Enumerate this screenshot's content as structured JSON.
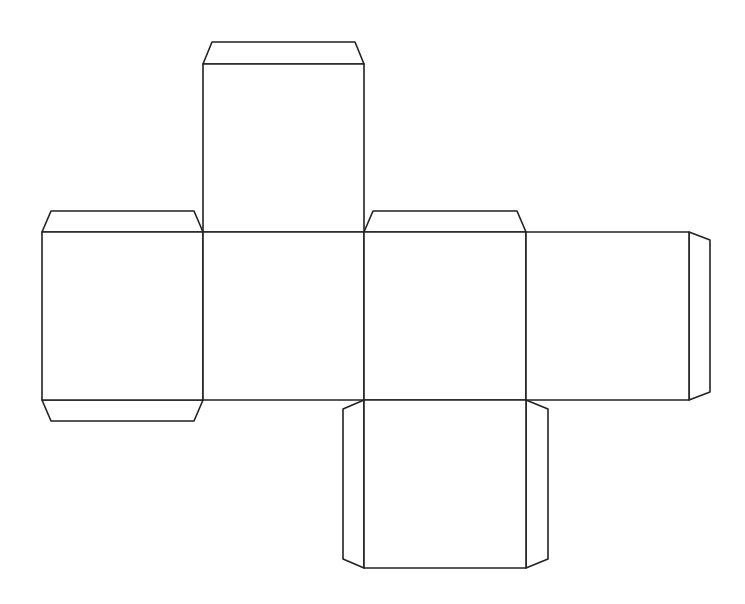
{
  "diagram": {
    "type": "cube-net",
    "stroke_color": "#222222",
    "background_color": "#ffffff",
    "faces": [
      {
        "id": "top",
        "x": 203,
        "y": 64,
        "w": 161,
        "h": 168
      },
      {
        "id": "left",
        "x": 42,
        "y": 232,
        "w": 161,
        "h": 168
      },
      {
        "id": "front",
        "x": 203,
        "y": 232,
        "w": 161,
        "h": 168
      },
      {
        "id": "right",
        "x": 364,
        "y": 232,
        "w": 162,
        "h": 168
      },
      {
        "id": "back",
        "x": 526,
        "y": 232,
        "w": 163,
        "h": 168
      },
      {
        "id": "bottom",
        "x": 364,
        "y": 400,
        "w": 162,
        "h": 168
      }
    ],
    "tabs": [
      {
        "id": "tab-top-face-top",
        "points": "203,64 212,42 355,42 364,64"
      },
      {
        "id": "tab-left-face-top",
        "points": "42,232 51,211 194,211 203,232"
      },
      {
        "id": "tab-left-face-bottom",
        "points": "42,400 51,421 194,421 203,400"
      },
      {
        "id": "tab-right-face-top",
        "points": "364,232 373,211 517,211 526,232"
      },
      {
        "id": "tab-back-face-right",
        "points": "689,232 710,240 710,392 689,400"
      },
      {
        "id": "tab-bottom-face-left",
        "points": "364,400 343,409 343,559 364,568"
      },
      {
        "id": "tab-bottom-face-right",
        "points": "526,400 548,409 548,559 526,568"
      }
    ]
  }
}
